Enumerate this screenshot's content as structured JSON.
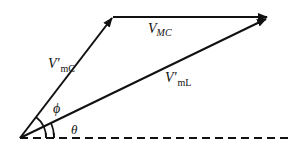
{
  "diagram": {
    "type": "phasor-diagram",
    "vectors": [
      {
        "id": "v_mc_prime",
        "label_main": "V'",
        "label_sub": "mC",
        "from": "origin",
        "to": "top-vertex"
      },
      {
        "id": "v_mc",
        "label_main": "V",
        "label_sub": "MC",
        "from": "top-vertex",
        "to": "tip"
      },
      {
        "id": "v_ml_prime",
        "label_main": "V'",
        "label_sub": "mL",
        "from": "origin",
        "to": "tip"
      }
    ],
    "reference_line": {
      "style": "dashed"
    },
    "angles": [
      {
        "id": "phi",
        "symbol": "ϕ",
        "between": [
          "v_mc_prime",
          "v_ml_prime"
        ]
      },
      {
        "id": "theta",
        "symbol": "θ",
        "between": [
          "v_ml_prime",
          "reference_line"
        ]
      }
    ],
    "colors": {
      "stroke": "#111111",
      "background": "#ffffff"
    }
  }
}
